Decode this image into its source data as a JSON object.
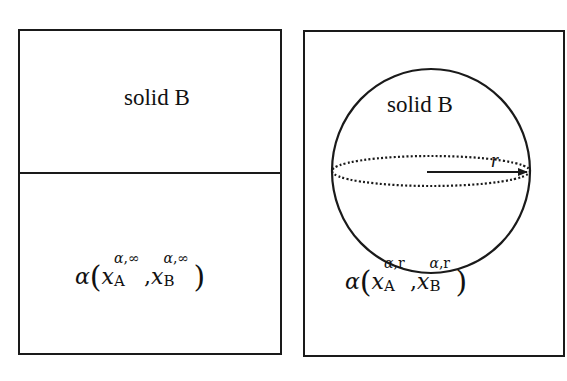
{
  "left_panel": {
    "region_label": "solid B",
    "formula": {
      "func": "α",
      "var": "x",
      "arg1": {
        "sub": "A",
        "sup_greek": "α",
        "sup_rest": ",∞"
      },
      "arg2": {
        "sub": "B",
        "sup_greek": "α",
        "sup_rest": ",∞"
      },
      "separator": ","
    }
  },
  "right_panel": {
    "region_label": "solid B",
    "radius_label": "r",
    "formula": {
      "func": "α",
      "var": "x",
      "arg1": {
        "sub": "A",
        "sup_greek": "α",
        "sup_rest": ",r"
      },
      "arg2": {
        "sub": "B",
        "sup_greek": "α",
        "sup_rest": ",r"
      },
      "separator": ","
    }
  },
  "colors": {
    "stroke": "#1a1a1a",
    "background": "#ffffff"
  }
}
